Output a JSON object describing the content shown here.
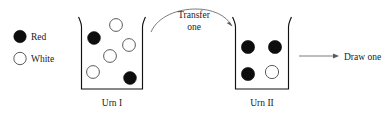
{
  "diagram": {
    "colors": {
      "red_ball": "#0d0d0d",
      "white_ball_fill": "#ffffff",
      "white_ball_stroke": "#4a4a4a",
      "urn_outline": "#111111",
      "arrow": "#5a5a5a",
      "text": "#1a1a1a",
      "background": "#ffffff"
    },
    "legend": {
      "items": [
        {
          "key": "red",
          "label": "Red",
          "swatch": "filled-circle-icon"
        },
        {
          "key": "white",
          "label": "White",
          "swatch": "open-circle-icon"
        }
      ]
    },
    "urns": [
      {
        "id": "urn-1",
        "label": "Urn I",
        "counts": {
          "red": 2,
          "white": 4
        },
        "balls": [
          {
            "color": "red",
            "cx": 94,
            "cy": 38,
            "r": 6.4
          },
          {
            "color": "white",
            "cx": 116,
            "cy": 25,
            "r": 6.4
          },
          {
            "color": "white",
            "cx": 129,
            "cy": 45,
            "r": 6.4
          },
          {
            "color": "white",
            "cx": 110,
            "cy": 56,
            "r": 6.4
          },
          {
            "color": "white",
            "cx": 93,
            "cy": 72,
            "r": 6.4
          },
          {
            "color": "red",
            "cx": 130,
            "cy": 78,
            "r": 6.4
          }
        ]
      },
      {
        "id": "urn-2",
        "label": "Urn II",
        "counts": {
          "red": 3,
          "white": 1
        },
        "balls": [
          {
            "color": "red",
            "cx": 248,
            "cy": 47,
            "r": 6.6
          },
          {
            "color": "red",
            "cx": 275,
            "cy": 47,
            "r": 6.6
          },
          {
            "color": "red",
            "cx": 248,
            "cy": 74,
            "r": 6.6
          },
          {
            "color": "white",
            "cx": 272,
            "cy": 72,
            "r": 6.6
          }
        ]
      }
    ],
    "annotations": [
      {
        "id": "transfer",
        "line_1": "Transfer",
        "line_2": "one",
        "arrow": "curved-arrow-right"
      },
      {
        "id": "draw",
        "text": "Draw one",
        "arrow": "straight-arrow-right"
      }
    ]
  }
}
